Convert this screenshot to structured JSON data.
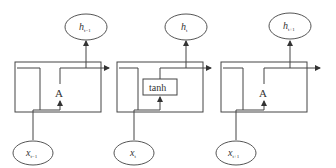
{
  "diagram": {
    "type": "unrolled-rnn",
    "colors": {
      "stroke": "#444444",
      "text": "#333333",
      "background": "#ffffff"
    },
    "cells": [
      {
        "id": "cell-t-1",
        "label": "A",
        "output": {
          "base": "h",
          "sub": "t−1"
        },
        "input": {
          "base": "x",
          "sub": "t−1"
        }
      },
      {
        "id": "cell-t",
        "label": "tanh",
        "output": {
          "base": "h",
          "sub": "t"
        },
        "input": {
          "base": "x",
          "sub": "t"
        }
      },
      {
        "id": "cell-t+1",
        "label": "A",
        "output": {
          "base": "h",
          "sub": "t+1"
        },
        "input": {
          "base": "x",
          "sub": "t+1"
        }
      }
    ]
  }
}
